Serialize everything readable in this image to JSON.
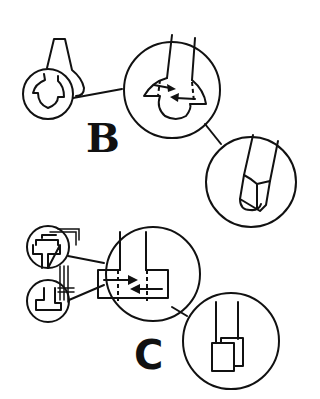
{
  "diagram": {
    "type": "technical-illustration",
    "stroke_color": "#111111",
    "background": "#ffffff",
    "groups": [
      {
        "id": "B",
        "label": "B",
        "panels": [
          {
            "name": "overview",
            "description": "small circle over a hooked/wedge bracket part"
          },
          {
            "name": "detail-1",
            "description": "enlarged bulb-shaped end with two arrows showing motion"
          },
          {
            "name": "detail-2",
            "description": "enlarged tip with cap fitted on end"
          }
        ]
      },
      {
        "id": "C",
        "label": "C",
        "panels": [
          {
            "name": "overview-top",
            "description": "small circle over T-shaped stacked parts"
          },
          {
            "name": "overview-bottom",
            "description": "small circle over lower T-shaped part"
          },
          {
            "name": "detail-1",
            "description": "enlarged rectangular junction with two opposing arrows"
          },
          {
            "name": "detail-2",
            "description": "enlarged end with two overlapping square plates"
          }
        ]
      }
    ]
  }
}
